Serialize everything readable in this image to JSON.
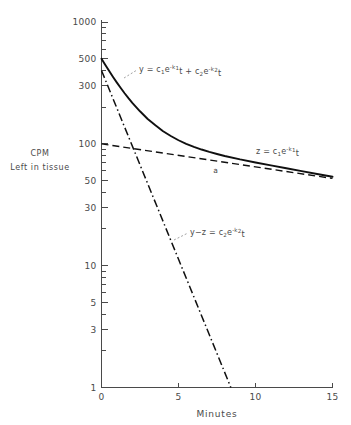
{
  "figure": {
    "corner_marks": {
      "left": "",
      "right": ""
    }
  },
  "chart_data": {
    "type": "line",
    "title": "",
    "xlabel": "Minutes",
    "ylabel_line1": "CPM",
    "ylabel_line2": "Left in tissue",
    "yscale": "log",
    "xscale": "linear",
    "xlim": [
      0,
      15
    ],
    "ylim": [
      1,
      1000
    ],
    "grid": false,
    "legend_position": "inline-annotations",
    "xticks": [
      0,
      5,
      10,
      15
    ],
    "xtick_labels": [
      "0",
      "5",
      "10",
      "15"
    ],
    "yticks": [
      1,
      3,
      5,
      10,
      30,
      50,
      100,
      300,
      500,
      1000
    ],
    "ytick_labels": [
      "1",
      "3",
      "5",
      "10",
      "30",
      "50",
      "100",
      "300",
      "500",
      "1000"
    ],
    "y_minor_ticks": [
      2,
      4,
      6,
      7,
      8,
      9,
      20,
      40,
      60,
      70,
      80,
      90,
      200,
      400,
      600,
      700,
      800,
      900
    ],
    "annotations": [
      {
        "name": "intersection-point",
        "label": "a",
        "x": 7.4,
        "y": 72
      }
    ],
    "series": [
      {
        "name": "y-total",
        "label": "y = c₁e⁻ᵏ₁t + c₂e⁻ᵏ₂t",
        "style": "solid",
        "equation_parts": {
          "lhs": "y",
          "eq": " = ",
          "c1": "c",
          "c1sub": "1",
          "e1": "e",
          "e1sup": "-k",
          "e1supsub": "1",
          "e1t": "t",
          "plus": " + ",
          "c2": "c",
          "c2sub": "2",
          "e2": "e",
          "e2sup": "-k",
          "e2supsub": "2",
          "e2t": "t"
        },
        "x": [
          0,
          0.25,
          0.5,
          0.75,
          1,
          1.25,
          1.5,
          1.75,
          2,
          2.5,
          3,
          3.5,
          4,
          4.5,
          5,
          5.5,
          6,
          6.5,
          7,
          7.5,
          8,
          9,
          10,
          11,
          12,
          13,
          14,
          15
        ],
        "y": [
          500,
          444,
          396,
          354,
          318,
          287,
          260,
          237,
          217,
          185,
          160,
          142,
          127,
          116,
          107,
          100,
          94.5,
          89.8,
          85.9,
          82.5,
          79.5,
          74.5,
          70.3,
          66.5,
          63.0,
          59.7,
          56.6,
          53.7
        ]
      },
      {
        "name": "z-slow-component",
        "label": "z = c₁e⁻ᵏ₁t",
        "style": "dashed",
        "equation_parts": {
          "lhs": "z",
          "eq": " = ",
          "c1": "c",
          "c1sub": "1",
          "e1": "e",
          "e1sup": "-k",
          "e1supsub": "1",
          "e1t": "t"
        },
        "x": [
          0,
          15
        ],
        "y": [
          100,
          52
        ]
      },
      {
        "name": "y-minus-z-fast-component",
        "label": "y−z = c₂e⁻ᵏ₂t",
        "style": "dash-dot",
        "equation_parts": {
          "lhs": "y−z",
          "eq": " = ",
          "c2": "c",
          "c2sub": "2",
          "e2": "e",
          "e2sup": "-k",
          "e2supsub": "2",
          "e2t": "t"
        },
        "x": [
          0,
          8.4
        ],
        "y": [
          400,
          1
        ]
      }
    ]
  }
}
